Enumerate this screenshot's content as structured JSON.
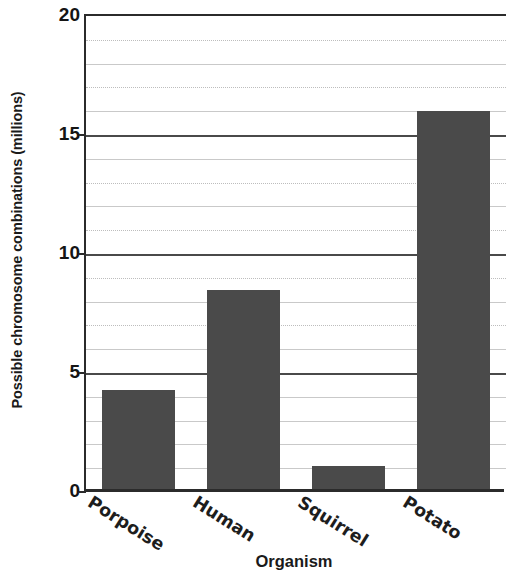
{
  "chart_data": {
    "type": "bar",
    "title": "",
    "xlabel": "Organism",
    "ylabel": "Possible chromosome combinations (millions)",
    "categories": [
      "Porpoise",
      "Human",
      "Squirrel",
      "Potato"
    ],
    "values": [
      4.3,
      8.5,
      1.1,
      16.0
    ],
    "ylim": [
      0,
      20
    ],
    "ytick_labels": [
      "0",
      "5",
      "10",
      "15",
      "20"
    ],
    "ytick_values": [
      0,
      5,
      10,
      15,
      20
    ],
    "grid": "horizontal-every-1-unit",
    "grid_major_interval": 5,
    "grid_minor_interval": 1,
    "legend": "none",
    "bar_color": "#4a4a4a",
    "axis_color": "#2b2b2b",
    "gridline_color": "#c9c9c9",
    "xtick_rotation_degrees": 32
  }
}
